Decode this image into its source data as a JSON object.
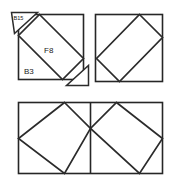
{
  "figure": {
    "background_color": "#ffffff",
    "line_color": "#2b2b2b",
    "label_color": "#1a1a1a"
  },
  "labels": {
    "b15": "B15",
    "f8": "F8",
    "b3": "B3"
  },
  "panels": [
    {
      "id": "top-left",
      "name": "top-left-square",
      "x": 18,
      "y": 14,
      "width": 66,
      "height": 66,
      "inner": "rotated-square",
      "labels": [
        "B15",
        "F8",
        "B3"
      ]
    },
    {
      "id": "top-right",
      "name": "top-right-square",
      "x": 95,
      "y": 14,
      "width": 68,
      "height": 68,
      "inner": "rotated-rectangle",
      "labels": []
    },
    {
      "id": "bottom",
      "name": "bottom-rectangle",
      "x": 18,
      "y": 102,
      "width": 145,
      "height": 72,
      "inner": "two-rotated-squares",
      "divider": "vertical-center",
      "labels": []
    }
  ],
  "accents": {
    "b15_triangle": "top-left-corner-triangle",
    "b3_triangle": "bottom-right-corner-triangle"
  }
}
